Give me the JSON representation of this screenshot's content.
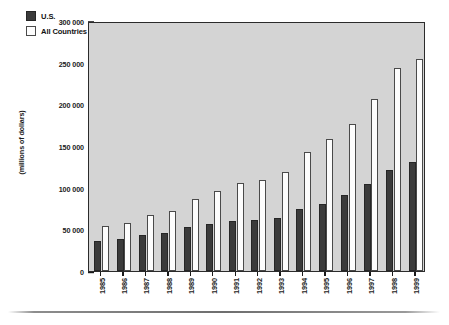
{
  "chart_data": {
    "type": "bar",
    "title": "",
    "subtitle": "",
    "xlabel": "",
    "ylabel": "(millions of dollars)",
    "categories": [
      "1985",
      "1986",
      "1987",
      "1988",
      "1989",
      "1990",
      "1991",
      "1992",
      "1993",
      "1994",
      "1995",
      "1996",
      "1997",
      "1998",
      "1999"
    ],
    "series": [
      {
        "name": "U.S.",
        "color": "#3b3b3b",
        "values": [
          36000,
          39000,
          43000,
          46000,
          53000,
          57000,
          60000,
          61000,
          64000,
          74000,
          81000,
          91000,
          104000,
          121000,
          131000
        ]
      },
      {
        "name": "All Countries",
        "color": "#ffffff",
        "values": [
          54000,
          58000,
          67000,
          72000,
          87000,
          96000,
          106000,
          109000,
          119000,
          143000,
          158000,
          177000,
          206000,
          244000,
          255000
        ]
      }
    ],
    "ylim": [
      0,
      300000
    ],
    "yticks": [
      0,
      50000,
      100000,
      150000,
      200000,
      250000,
      300000
    ],
    "ytick_labels": [
      "0",
      "50 000",
      "100 000",
      "150 000",
      "200 000",
      "250 000",
      "300 000"
    ],
    "grid": false,
    "legend_position": "top-left",
    "plot_background": "#d4d4d4",
    "axis_color": "#2b2b2b"
  },
  "legend": {
    "items": [
      {
        "label": "U.S."
      },
      {
        "label": "All Countries"
      }
    ]
  }
}
